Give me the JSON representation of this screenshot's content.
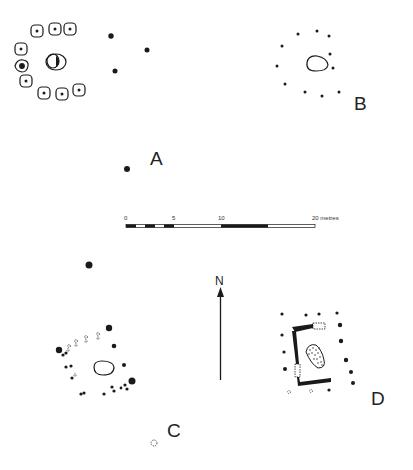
{
  "figure": {
    "type": "archaeological site plan",
    "ink_color": "#1a1a1a",
    "background": "#ffffff"
  },
  "structures": {
    "A": {
      "label": "A",
      "label_pos": [
        123,
        158
      ]
    },
    "B": {
      "label": "B",
      "label_pos": [
        357,
        99
      ]
    },
    "C": {
      "label": "C",
      "label_pos": [
        168,
        424
      ]
    },
    "D": {
      "label": "D",
      "label_pos": [
        372,
        393
      ]
    }
  },
  "scale_bar": {
    "ticks": [
      {
        "label": "0",
        "x": 126
      },
      {
        "label": "5",
        "x": 174
      },
      {
        "label": "10",
        "x": 221
      },
      {
        "label": "20 metres",
        "x": 312
      }
    ],
    "unit": "metres"
  },
  "north_arrow": {
    "label": "N"
  }
}
